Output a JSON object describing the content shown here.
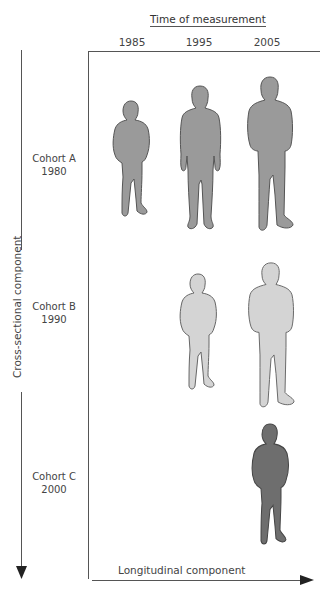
{
  "header": {
    "title": "Time of measurement",
    "years": [
      "1985",
      "1995",
      "2005"
    ]
  },
  "cohorts": [
    {
      "name": "Cohort A",
      "year": "1980"
    },
    {
      "name": "Cohort B",
      "year": "1990"
    },
    {
      "name": "Cohort C",
      "year": "2000"
    }
  ],
  "axes": {
    "y_label": "Cross-sectional component",
    "x_label": "Longitudinal component"
  },
  "figures": {
    "cohort_a_color": "#9a9a9a",
    "cohort_b_color": "#d4d4d4",
    "cohort_c_color": "#6e6e6e",
    "outline_color": "#555555"
  }
}
